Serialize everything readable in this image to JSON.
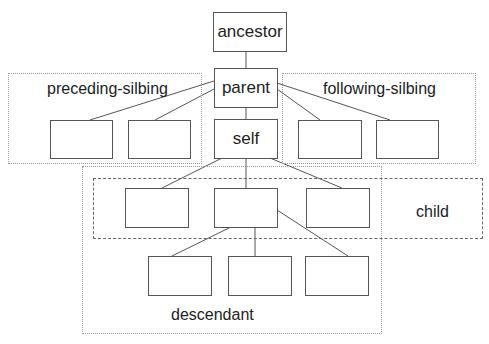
{
  "diagram": {
    "nodes": {
      "ancestor": "ancestor",
      "parent": "parent",
      "self": "self"
    },
    "regions": {
      "preceding_sibling": "preceding-silbing",
      "following_sibling": "following-silbing",
      "child": "child",
      "descendant": "descendant"
    },
    "colors": {
      "line": "#555555",
      "box_border": "#555555",
      "dotted_border": "#999999",
      "dashed_border": "#666666",
      "background": "#ffffff"
    }
  }
}
